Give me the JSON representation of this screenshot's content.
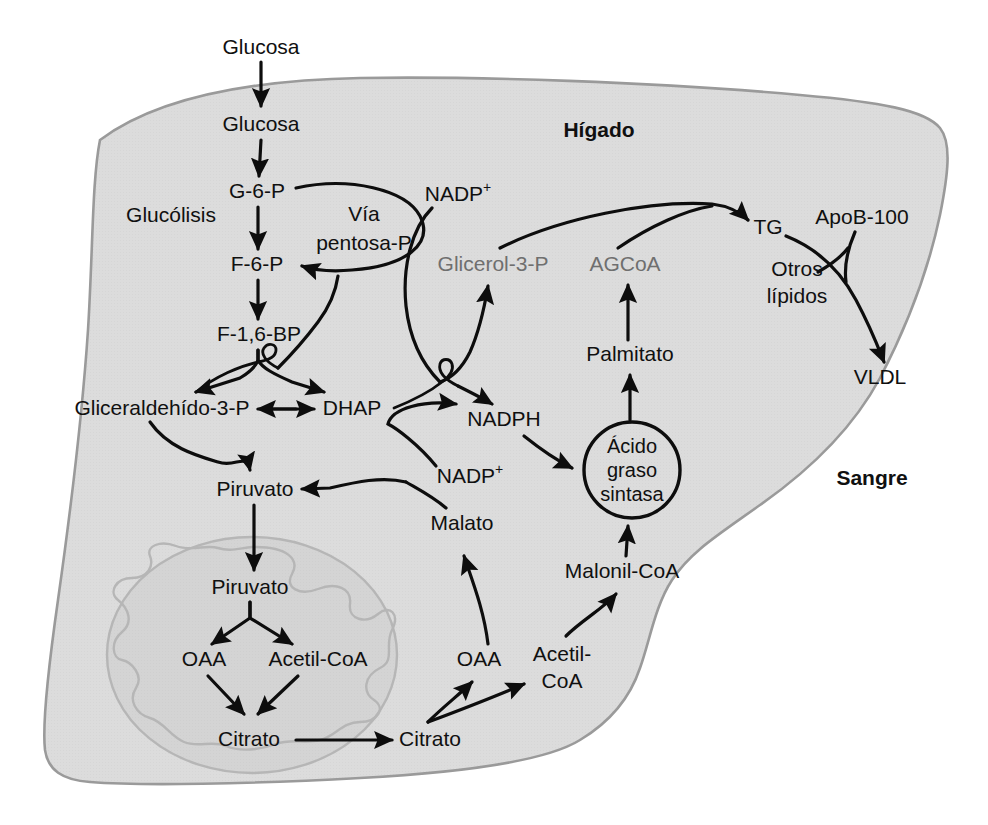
{
  "figure": {
    "type": "biochemical-pathway-diagram",
    "language": "es"
  },
  "compartments": {
    "liver": {
      "label": "Hígado",
      "fill": "#dcdcdc",
      "stroke": "#9a9a9a"
    },
    "blood": {
      "label": "Sangre",
      "fill": "#ffffff"
    },
    "mitochondrion": {
      "fill": "#d5d5d5",
      "stroke": "#b0b0b0"
    }
  },
  "pathway_labels": [
    {
      "id": "glucolisis",
      "text": "Glucólisis",
      "x": 171,
      "y": 216
    },
    {
      "id": "via-pentosa-line1",
      "text": "Vía",
      "x": 364,
      "y": 215
    },
    {
      "id": "via-pentosa-line2",
      "text": "pentosa-P",
      "x": 364,
      "y": 244
    }
  ],
  "enzyme": {
    "name_line1": "Ácido",
    "name_line2": "graso",
    "name_line3": "sintasa",
    "cx": 632,
    "cy": 470,
    "r": 48
  },
  "metabolites": [
    {
      "id": "glucosa-sangre",
      "text": "Glucosa",
      "x": 261,
      "y": 48,
      "color": "black"
    },
    {
      "id": "glucosa-higado",
      "text": "Glucosa",
      "x": 261,
      "y": 125,
      "color": "black"
    },
    {
      "id": "g6p",
      "text": "G-6-P",
      "x": 257,
      "y": 192,
      "color": "black"
    },
    {
      "id": "f6p",
      "text": "F-6-P",
      "x": 257,
      "y": 265,
      "color": "black"
    },
    {
      "id": "f16bp",
      "text": "F-1,6-BP",
      "x": 259,
      "y": 335,
      "color": "black"
    },
    {
      "id": "gliceraldehido3p",
      "text": "Gliceraldehído-3-P",
      "x": 162,
      "y": 409,
      "color": "black"
    },
    {
      "id": "dhap",
      "text": "DHAP",
      "x": 352,
      "y": 409,
      "color": "black"
    },
    {
      "id": "piruvato-citosol",
      "text": "Piruvato",
      "x": 255,
      "y": 490,
      "color": "black"
    },
    {
      "id": "piruvato-mito",
      "text": "Piruvato",
      "x": 250,
      "y": 588,
      "color": "black"
    },
    {
      "id": "oaa-mito",
      "text": "OAA",
      "x": 204,
      "y": 660,
      "color": "black"
    },
    {
      "id": "acetilcoa-mito",
      "text": "Acetil-CoA",
      "x": 318,
      "y": 660,
      "color": "black"
    },
    {
      "id": "citrato-mito",
      "text": "Citrato",
      "x": 249,
      "y": 740,
      "color": "black"
    },
    {
      "id": "citrato-citosol",
      "text": "Citrato",
      "x": 430,
      "y": 740,
      "color": "black"
    },
    {
      "id": "oaa-citosol",
      "text": "OAA",
      "x": 479,
      "y": 660,
      "color": "black"
    },
    {
      "id": "acetilcoa-citosol-line1",
      "text": "Acetil-",
      "x": 562,
      "y": 655,
      "color": "black"
    },
    {
      "id": "acetilcoa-citosol-line2",
      "text": "CoA",
      "x": 562,
      "y": 682,
      "color": "black"
    },
    {
      "id": "malato",
      "text": "Malato",
      "x": 462,
      "y": 524,
      "color": "black"
    },
    {
      "id": "nadp-plus-top",
      "text": "NADP",
      "sup": "+",
      "x": 458,
      "y": 195,
      "color": "black"
    },
    {
      "id": "nadp-plus-mid",
      "text": "NADP",
      "sup": "+",
      "x": 470,
      "y": 477,
      "color": "black"
    },
    {
      "id": "nadph",
      "text": "NADPH",
      "x": 504,
      "y": 420,
      "color": "black"
    },
    {
      "id": "glicerol3p",
      "text": "Glicerol-3-P",
      "x": 493,
      "y": 265,
      "color": "gray"
    },
    {
      "id": "agcoa",
      "text": "AGCoA",
      "x": 625,
      "y": 265,
      "color": "gray"
    },
    {
      "id": "palmitato",
      "text": "Palmitato",
      "x": 630,
      "y": 355,
      "color": "black"
    },
    {
      "id": "malonilcoa",
      "text": "Malonil-CoA",
      "x": 622,
      "y": 572,
      "color": "black"
    },
    {
      "id": "tg",
      "text": "TG",
      "x": 768,
      "y": 228,
      "color": "black"
    },
    {
      "id": "apob100",
      "text": "ApoB-100",
      "x": 862,
      "y": 218,
      "color": "black"
    },
    {
      "id": "otros-lipidos-line1",
      "text": "Otros",
      "x": 797,
      "y": 270,
      "color": "black"
    },
    {
      "id": "otros-lipidos-line2",
      "text": "lípidos",
      "x": 797,
      "y": 297,
      "color": "black"
    },
    {
      "id": "vldl",
      "text": "VLDL",
      "x": 880,
      "y": 378,
      "color": "black"
    }
  ],
  "region_labels": [
    {
      "id": "higado",
      "text": "Hígado",
      "x": 599,
      "y": 131,
      "bold": true
    },
    {
      "id": "sangre",
      "text": "Sangre",
      "x": 872,
      "y": 479,
      "bold": true
    }
  ],
  "edges": [
    {
      "from": "glucosa-sangre",
      "to": "glucosa-higado",
      "kind": "straight-arrow"
    },
    {
      "from": "glucosa-higado",
      "to": "g6p",
      "kind": "straight-arrow"
    },
    {
      "from": "g6p",
      "to": "f6p",
      "kind": "straight-arrow"
    },
    {
      "from": "g6p",
      "to": "f6p",
      "kind": "curved-arrow",
      "note": "vía pentosa fosfato"
    },
    {
      "from": "f6p",
      "to": "f16bp",
      "kind": "straight-arrow"
    },
    {
      "from": "f16bp",
      "to": "gliceraldehido3p",
      "kind": "split-arrow"
    },
    {
      "from": "f16bp",
      "to": "dhap",
      "kind": "split-arrow"
    },
    {
      "from": "gliceraldehido3p",
      "to": "dhap",
      "kind": "double-arrow"
    },
    {
      "from": "gliceraldehido3p",
      "to": "piruvato-citosol",
      "kind": "curved-arrow"
    },
    {
      "from": "piruvato-citosol",
      "to": "piruvato-mito",
      "kind": "straight-arrow"
    },
    {
      "from": "piruvato-mito",
      "to": "oaa-mito",
      "kind": "straight-arrow"
    },
    {
      "from": "piruvato-mito",
      "to": "acetilcoa-mito",
      "kind": "straight-arrow"
    },
    {
      "from": "oaa-mito",
      "to": "citrato-mito",
      "kind": "straight-arrow"
    },
    {
      "from": "acetilcoa-mito",
      "to": "citrato-mito",
      "kind": "straight-arrow"
    },
    {
      "from": "citrato-mito",
      "to": "citrato-citosol",
      "kind": "straight-arrow"
    },
    {
      "from": "citrato-citosol",
      "to": "oaa-citosol",
      "kind": "curved-arrow"
    },
    {
      "from": "citrato-citosol",
      "to": "acetilcoa-citosol",
      "kind": "curved-arrow"
    },
    {
      "from": "oaa-citosol",
      "to": "malato",
      "kind": "curved-arrow"
    },
    {
      "from": "malato",
      "to": "piruvato-citosol",
      "kind": "curved-arrow"
    },
    {
      "from": "nadp-plus-mid",
      "to": "nadph",
      "kind": "curved-arrow"
    },
    {
      "from": "nadph",
      "to": "acido-graso-sintasa",
      "kind": "curved-arrow"
    },
    {
      "from": "acetilcoa-citosol",
      "to": "malonilcoa",
      "kind": "curved-arrow"
    },
    {
      "from": "malonilcoa",
      "to": "acido-graso-sintasa",
      "kind": "straight-arrow"
    },
    {
      "from": "acido-graso-sintasa",
      "to": "palmitato",
      "kind": "straight-arrow"
    },
    {
      "from": "palmitato",
      "to": "agcoa",
      "kind": "straight-arrow"
    },
    {
      "from": "dhap",
      "to": "glicerol3p",
      "kind": "curved-arrow"
    },
    {
      "from": "nadp-plus-top",
      "to": "nadph",
      "kind": "curved-arrow"
    },
    {
      "from": "glicerol3p",
      "to": "tg",
      "kind": "curved-arrow"
    },
    {
      "from": "agcoa",
      "to": "tg",
      "kind": "curved-arrow"
    },
    {
      "from": "tg",
      "to": "vldl",
      "kind": "curved-arrow"
    },
    {
      "from": "apob100",
      "to": "vldl",
      "kind": "curved-arrow"
    }
  ]
}
